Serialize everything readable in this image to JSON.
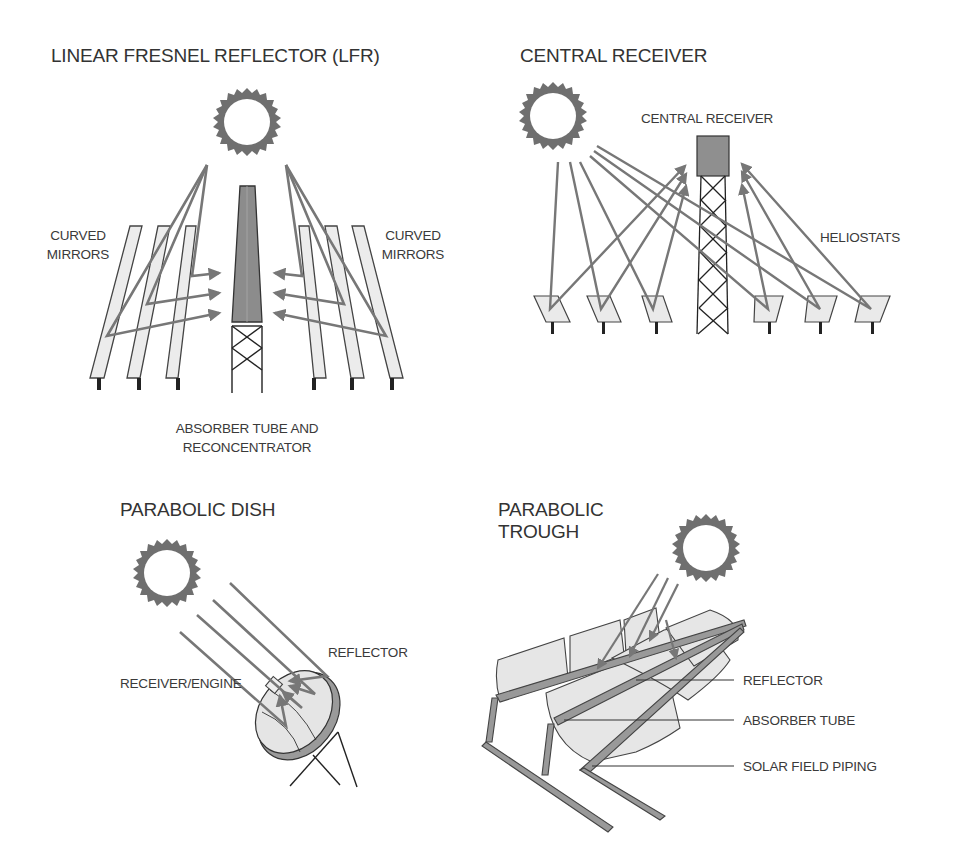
{
  "figure": {
    "colors": {
      "ray": "#777777",
      "sun": "#6f6f6f",
      "mirror_fill": "#e8e8e8",
      "absorber_fill": "#909090",
      "outline": "#333333",
      "background": "#ffffff"
    },
    "panels": {
      "lfr": {
        "title": "LINEAR FRESNEL REFLECTOR (LFR)",
        "label_left_line1": "CURVED",
        "label_left_line2": "MIRRORS",
        "label_right_line1": "CURVED",
        "label_right_line2": "MIRRORS",
        "label_bottom_line1": "ABSORBER TUBE AND",
        "label_bottom_line2": "RECONCENTRATOR",
        "icons": [
          "sun-icon",
          "curved-mirror-icon",
          "absorber-tower-icon"
        ]
      },
      "central_receiver": {
        "title": "CENTRAL RECEIVER",
        "label_receiver": "CENTRAL RECEIVER",
        "label_heliostats": "HELIOSTATS",
        "icons": [
          "sun-icon",
          "receiver-tower-icon",
          "heliostat-icon"
        ]
      },
      "parabolic_dish": {
        "title": "PARABOLIC DISH",
        "label_reflector": "REFLECTOR",
        "label_receiver": "RECEIVER/ENGINE",
        "icons": [
          "sun-icon",
          "dish-reflector-icon",
          "receiver-engine-icon"
        ]
      },
      "parabolic_trough": {
        "title_line1": "PARABOLIC",
        "title_line2": "TROUGH",
        "label_reflector": "REFLECTOR",
        "label_absorber": "ABSORBER TUBE",
        "label_piping": "SOLAR FIELD PIPING",
        "icons": [
          "sun-icon",
          "trough-reflector-icon",
          "piping-icon"
        ]
      }
    }
  }
}
